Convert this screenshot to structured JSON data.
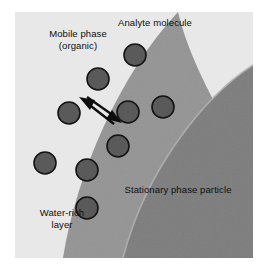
{
  "figure": {
    "background_color": "#e8e8e8",
    "regions": [
      {
        "name": "mobile-phase-region",
        "label": "Mobile phase\n(organic)",
        "color": "#e8e8e8"
      },
      {
        "name": "water-rich-layer-region",
        "label": "Water-rich\nlayer",
        "color": "#949494"
      },
      {
        "name": "stationary-phase-region",
        "label": "Stationary phase particle",
        "color": "#7d7d7d"
      }
    ],
    "labels": [
      {
        "name": "mobile-phase-label",
        "text": "Mobile phase\n(organic)",
        "x": 22,
        "y": 22
      },
      {
        "name": "analyte-molecule-label",
        "text": "Analyte molecule",
        "x": 99,
        "y": 14
      },
      {
        "name": "stationary-phase-label",
        "text": "Stationary phase particle",
        "x": 113,
        "y": 183
      },
      {
        "name": "water-rich-layer-label",
        "text": "Water-rich\nlayer",
        "x": 22,
        "y": 206
      }
    ],
    "molecules": [
      {
        "name": "analyte-molecule",
        "cx": 120,
        "cy": 43,
        "r": 11
      },
      {
        "name": "analyte-molecule",
        "cx": 83,
        "cy": 67,
        "r": 11
      },
      {
        "name": "analyte-molecule",
        "cx": 54,
        "cy": 101,
        "r": 11
      },
      {
        "name": "analyte-molecule",
        "cx": 113,
        "cy": 100,
        "r": 11
      },
      {
        "name": "analyte-molecule",
        "cx": 148,
        "cy": 95,
        "r": 11
      },
      {
        "name": "analyte-molecule",
        "cx": 103,
        "cy": 134,
        "r": 11
      },
      {
        "name": "analyte-molecule",
        "cx": 30,
        "cy": 151,
        "r": 11
      },
      {
        "name": "analyte-molecule",
        "cx": 72,
        "cy": 158,
        "r": 11
      },
      {
        "name": "analyte-molecule",
        "cx": 72,
        "cy": 196,
        "r": 11
      }
    ],
    "arrows": [
      {
        "name": "desorption-arrow",
        "direction": "up-left",
        "x1": 99,
        "y1": 112,
        "x2": 68,
        "y2": 88
      },
      {
        "name": "adsorption-arrow",
        "direction": "down-right",
        "x1": 72,
        "y1": 85,
        "x2": 104,
        "y2": 110
      }
    ],
    "colors": {
      "background": "#e8e8e8",
      "water_rich_layer": "#949494",
      "stationary_phase": "#7d7d7d",
      "molecule_fill": "#5a5a5a",
      "molecule_stroke": "#141414",
      "arrow": "#0d0d0d",
      "text": "#0d0d0d"
    }
  }
}
